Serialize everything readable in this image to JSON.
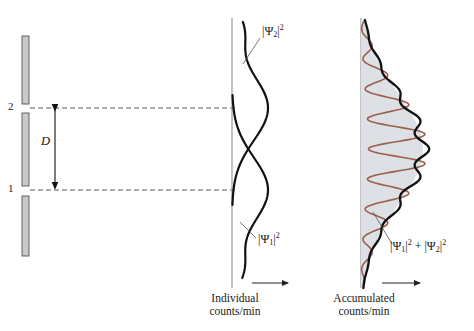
{
  "figure": {
    "background_color": "#ffffff",
    "width": 474,
    "height": 331
  },
  "barrier": {
    "name": "double-slit-barrier",
    "fill_color": "#c9c9c9",
    "edge_color": "#555555",
    "segments": [
      {
        "x": 22,
        "y": 36,
        "w": 7,
        "h": 68
      },
      {
        "x": 22,
        "y": 113,
        "w": 7,
        "h": 73
      },
      {
        "x": 22,
        "y": 196,
        "w": 7,
        "h": 60
      }
    ],
    "slits": [
      {
        "label": "2",
        "y": 108
      },
      {
        "label": "1",
        "y": 190
      }
    ]
  },
  "slit_labels": [
    {
      "text": "2",
      "x": 8,
      "y": 101
    },
    {
      "text": "1",
      "x": 8,
      "y": 183
    }
  ],
  "separation": {
    "label": "D",
    "label_x": 42,
    "label_y": 141,
    "arrow_x": 55,
    "y_top": 108,
    "y_bottom": 190,
    "color": "#111111"
  },
  "dashed_lines": {
    "color": "#5a5a5a",
    "dash": "5,3",
    "x_start": 30,
    "x_end": 237,
    "rows": [
      108,
      190
    ]
  },
  "axes": {
    "color": "#9a9a9a",
    "individual_axis_x": 232,
    "accumulated_axis_x": 361,
    "y_top": 18,
    "y_bottom": 288
  },
  "panels": [
    {
      "id": "individual",
      "name": "individual-counts-panel",
      "caption_line1": "Individual",
      "caption_line2": "counts/min",
      "caption_x": 234,
      "caption_y": 293,
      "arrow": {
        "x_start": 252,
        "x_end": 288,
        "y": 283
      },
      "curves": [
        {
          "name": "psi2-curve",
          "label": "|Ψ₂|²",
          "label_text": "Ψ",
          "label_sub": "2",
          "label_sup": "2",
          "color": "#111111",
          "width": 2.2,
          "peak_y": 108,
          "description": "single-slit intensity from slit 2"
        },
        {
          "name": "psi1-curve",
          "label": "|Ψ₁|²",
          "label_text": "Ψ",
          "label_sub": "1",
          "label_sup": "2",
          "color": "#111111",
          "width": 2.2,
          "peak_y": 190,
          "description": "single-slit intensity from slit 1"
        }
      ],
      "labels": [
        {
          "name": "psi2-label",
          "psi": "Ψ",
          "sub": "2",
          "sup": "2",
          "x": 262,
          "y": 24
        },
        {
          "name": "psi1-label",
          "psi": "Ψ",
          "sub": "1",
          "sup": "2",
          "x": 258,
          "y": 234
        }
      ],
      "leaders": [
        {
          "from_x": 260,
          "from_y": 38,
          "to_x": 243,
          "to_y": 64
        },
        {
          "from_x": 256,
          "from_y": 238,
          "to_x": 240,
          "to_y": 222
        }
      ]
    },
    {
      "id": "accumulated",
      "name": "accumulated-counts-panel",
      "caption_line1": "Accumulated",
      "caption_line2": "counts/min",
      "caption_x": 362,
      "caption_y": 293,
      "arrow": {
        "x_start": 382,
        "x_end": 420,
        "y": 283
      },
      "shading_color": "#dde1e6",
      "envelope": {
        "name": "sum-envelope-curve",
        "label_psi1": "Ψ",
        "label_sub1": "1",
        "label_sup1": "2",
        "label_plus": "+",
        "label_psi2": "Ψ",
        "label_sub2": "2",
        "label_sup2": "2",
        "color": "#111111",
        "width": 2.3
      },
      "fringes": {
        "name": "interference-fringe-curve",
        "color": "#9c5e4e",
        "width": 1.6,
        "n_fringes": 9
      },
      "labels": [
        {
          "name": "sum-label",
          "x": 392,
          "y": 240
        }
      ],
      "leader": {
        "from_x": 392,
        "from_y": 244,
        "to_x": 373,
        "to_y": 212
      }
    }
  ],
  "chart_data": {
    "type": "line",
    "xlabel": "counts/min",
    "ylabel": "position on detector",
    "orientation": "horizontal-intensity-vertical-position",
    "series": [
      {
        "name": "|Ψ1|²",
        "panel": "individual",
        "color": "#111111",
        "center_y": 190,
        "peak_amplitude": 38,
        "sigma": 52,
        "description": "Gaussian intensity profile from slit 1 alone"
      },
      {
        "name": "|Ψ2|²",
        "panel": "individual",
        "color": "#111111",
        "center_y": 108,
        "peak_amplitude": 38,
        "sigma": 52,
        "description": "Gaussian intensity profile from slit 2 alone"
      },
      {
        "name": "|Ψ1|² + |Ψ2|²",
        "panel": "accumulated",
        "color": "#111111",
        "center_y": 149,
        "peak_amplitude": 62,
        "sigma": 78,
        "description": "Envelope of the accumulated counts"
      },
      {
        "name": "interference fringes",
        "panel": "accumulated",
        "color": "#9c5e4e",
        "fringe_count": 9,
        "fringe_spacing_px": 30,
        "description": "Oscillating interference pattern modulated by the envelope"
      }
    ],
    "annotations": [
      {
        "text": "D",
        "meaning": "slit separation"
      },
      {
        "text": "1",
        "meaning": "lower slit"
      },
      {
        "text": "2",
        "meaning": "upper slit"
      }
    ],
    "grid": false,
    "legend": "inline-labels"
  }
}
